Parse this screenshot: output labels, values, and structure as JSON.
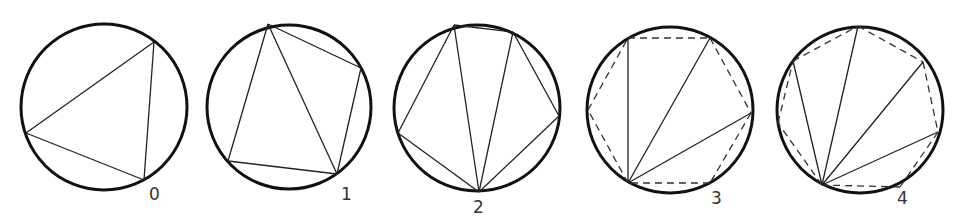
{
  "diagram": {
    "figures": [
      {
        "label": "0",
        "circle": {
          "cx": 104,
          "cy": 107,
          "r": 83
        },
        "solid": [
          [
            154,
            42,
            26,
            133
          ],
          [
            26,
            133,
            144,
            180
          ],
          [
            144,
            180,
            154,
            42
          ]
        ],
        "dashed": [],
        "label_pos": [
          149,
          200
        ]
      },
      {
        "label": "1",
        "circle": {
          "cx": 289,
          "cy": 107,
          "r": 82
        },
        "solid": [
          [
            268,
            24,
            361,
            68
          ],
          [
            361,
            68,
            337,
            174
          ],
          [
            337,
            174,
            228,
            161
          ],
          [
            228,
            161,
            268,
            24
          ],
          [
            268,
            24,
            337,
            174
          ]
        ],
        "dashed": [],
        "label_pos": [
          341,
          200
        ]
      },
      {
        "label": "2",
        "circle": {
          "cx": 477,
          "cy": 108,
          "r": 83
        },
        "solid": [
          [
            454,
            25,
            513,
            32
          ],
          [
            513,
            32,
            559,
            116
          ],
          [
            559,
            116,
            479,
            192
          ],
          [
            479,
            192,
            398,
            133
          ],
          [
            398,
            133,
            454,
            25
          ],
          [
            479,
            192,
            454,
            25
          ],
          [
            479,
            192,
            513,
            32
          ]
        ],
        "dashed": [],
        "label_pos": [
          473,
          213
        ]
      },
      {
        "label": "3",
        "circle": {
          "cx": 670,
          "cy": 110,
          "r": 83
        },
        "solid": [
          [
            628,
            183,
            628,
            38
          ],
          [
            628,
            183,
            710,
            38
          ],
          [
            628,
            183,
            751,
            113
          ]
        ],
        "dashed": [
          [
            628,
            38,
            710,
            38
          ],
          [
            710,
            38,
            751,
            113
          ],
          [
            751,
            113,
            710,
            183
          ],
          [
            710,
            183,
            628,
            183
          ],
          [
            628,
            183,
            588,
            110
          ],
          [
            588,
            110,
            628,
            38
          ]
        ],
        "label_pos": [
          711,
          204
        ]
      },
      {
        "label": "4",
        "circle": {
          "cx": 860,
          "cy": 110,
          "r": 83
        },
        "solid": [
          [
            822,
            185,
            793,
            61
          ],
          [
            822,
            185,
            858,
            26
          ],
          [
            822,
            185,
            923,
            62
          ],
          [
            822,
            185,
            938,
            132
          ]
        ],
        "dashed": [
          [
            793,
            61,
            858,
            26
          ],
          [
            858,
            26,
            923,
            62
          ],
          [
            923,
            62,
            938,
            132
          ],
          [
            938,
            132,
            900,
            187
          ],
          [
            900,
            187,
            822,
            185
          ],
          [
            822,
            185,
            778,
            123
          ],
          [
            778,
            123,
            793,
            61
          ]
        ],
        "label_pos": [
          897,
          204
        ]
      }
    ]
  }
}
